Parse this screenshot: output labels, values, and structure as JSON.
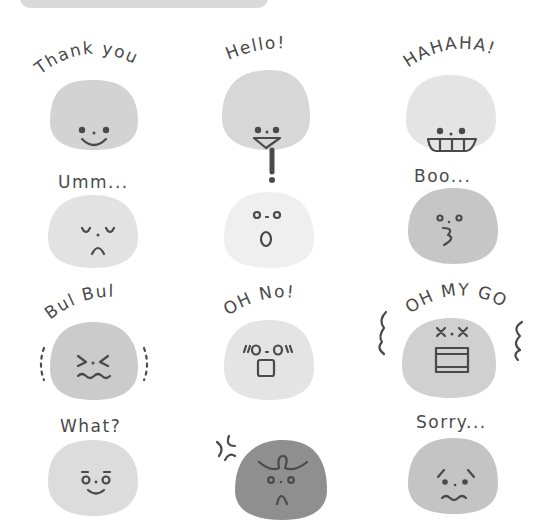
{
  "header_bar": {
    "color": "#d9d9d9"
  },
  "stickers": [
    {
      "label": "Thank you",
      "expression": "smile",
      "face_color": "#d3d3d3"
    },
    {
      "label": "Hello!",
      "expression": "open-smile",
      "face_color": "#d7d7d7"
    },
    {
      "label": "HAHAHA!",
      "expression": "grin",
      "face_color": "#e4e4e4"
    },
    {
      "label": "Umm...",
      "expression": "sleepy-frown",
      "face_color": "#e2e2e2"
    },
    {
      "label": "!",
      "expression": "surprised",
      "face_color": "#efefef"
    },
    {
      "label": "Boo...",
      "expression": "pout",
      "face_color": "#c6c6c6"
    },
    {
      "label": "Bul Bul",
      "expression": "shivering",
      "face_color": "#cbcbcb"
    },
    {
      "label": "OH No!",
      "expression": "shocked",
      "face_color": "#e4e4e4"
    },
    {
      "label": "OH MY GOD",
      "expression": "dead",
      "face_color": "#d0d0d0"
    },
    {
      "label": "What?",
      "expression": "curious",
      "face_color": "#dcdcdc"
    },
    {
      "label": "",
      "expression": "angry",
      "face_color": "#8f8f8f"
    },
    {
      "label": "Sorry...",
      "expression": "worried",
      "face_color": "#c4c4c4"
    }
  ],
  "ink_color": "#4a4a4a"
}
